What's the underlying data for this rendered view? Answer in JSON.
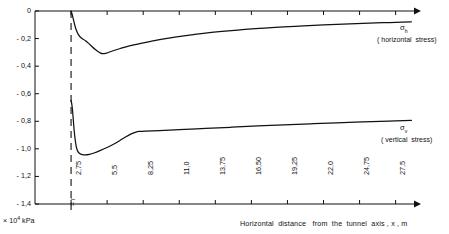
{
  "figure": {
    "background": "#ffffff",
    "ink": "#111111"
  },
  "axes": {
    "y": {
      "unit_prefix": "× 10",
      "unit_exp": "4",
      "unit_suffix": " kPa",
      "ticks": [
        "0",
        "- 0,2",
        "- 0,4",
        "- 0,6",
        "- 0,8",
        "- 1,0",
        "- 1,2",
        "- 1,4"
      ],
      "values": [
        0,
        -0.2,
        -0.4,
        -0.6,
        -0.8,
        -1.0,
        -1.2,
        -1.4
      ],
      "limits": [
        -1.4,
        0
      ]
    },
    "x": {
      "title": "Horizontal  distance   from  the  tunnel  axis , x , m",
      "ticks": [
        "2,75",
        "5,5",
        "8,25",
        "11,0",
        "13,75",
        "16,50",
        "19,25",
        "22,0",
        "24,75",
        "27,5"
      ],
      "values": [
        2.75,
        5.5,
        8.25,
        11.0,
        13.75,
        16.5,
        19.25,
        22.0,
        24.75,
        27.5
      ],
      "limits": [
        0,
        28.9
      ]
    },
    "tunnel_radius_marker": {
      "label": "= r",
      "x_value": 2.75
    }
  },
  "annotations": {
    "sigma_h": {
      "symbol": "σ",
      "subscript": "h",
      "description": "( horizontal  stress)"
    },
    "sigma_v": {
      "symbol": "σ",
      "subscript": "v",
      "description": "( vertical  stress)"
    }
  },
  "chart_data": {
    "type": "line",
    "title": "",
    "xlabel": "Horizontal  distance   from  the  tunnel  axis , x , m",
    "ylabel": "× 10⁴ kPa",
    "xlim": [
      0,
      28.9
    ],
    "ylim": [
      -1.4,
      0
    ],
    "grid": false,
    "legend_position": "right-inline",
    "xticks": [
      2.75,
      5.5,
      8.25,
      11.0,
      13.75,
      16.5,
      19.25,
      22.0,
      24.75,
      27.5
    ],
    "yticks": [
      0,
      -0.2,
      -0.4,
      -0.6,
      -0.8,
      -1.0,
      -1.2,
      -1.4
    ],
    "series": [
      {
        "name": "σh (horizontal stress)",
        "color": "#111111",
        "points": [
          [
            2.75,
            0.0
          ],
          [
            2.82,
            -0.02
          ],
          [
            2.95,
            -0.07
          ],
          [
            3.1,
            -0.125
          ],
          [
            3.3,
            -0.17
          ],
          [
            3.55,
            -0.198
          ],
          [
            3.85,
            -0.215
          ],
          [
            4.2,
            -0.245
          ],
          [
            4.6,
            -0.28
          ],
          [
            4.95,
            -0.303
          ],
          [
            5.15,
            -0.31
          ],
          [
            5.45,
            -0.305
          ],
          [
            5.9,
            -0.29
          ],
          [
            6.5,
            -0.272
          ],
          [
            7.2,
            -0.253
          ],
          [
            8.0,
            -0.236
          ],
          [
            9.0,
            -0.216
          ],
          [
            10.2,
            -0.196
          ],
          [
            11.5,
            -0.178
          ],
          [
            13.0,
            -0.16
          ],
          [
            14.5,
            -0.146
          ],
          [
            16.0,
            -0.134
          ],
          [
            17.5,
            -0.124
          ],
          [
            19.0,
            -0.116
          ],
          [
            20.5,
            -0.108
          ],
          [
            22.0,
            -0.101
          ],
          [
            23.5,
            -0.095
          ],
          [
            25.0,
            -0.09
          ],
          [
            26.5,
            -0.085
          ],
          [
            28.0,
            -0.081
          ],
          [
            28.7,
            -0.079
          ]
        ]
      },
      {
        "name": "σv (vertical stress)",
        "color": "#111111",
        "points": [
          [
            2.75,
            -0.648
          ],
          [
            2.8,
            -0.672
          ],
          [
            2.86,
            -0.72
          ],
          [
            2.93,
            -0.8
          ],
          [
            3.0,
            -0.88
          ],
          [
            3.08,
            -0.945
          ],
          [
            3.16,
            -0.99
          ],
          [
            3.26,
            -1.018
          ],
          [
            3.4,
            -1.034
          ],
          [
            3.6,
            -1.042
          ],
          [
            3.85,
            -1.044
          ],
          [
            4.15,
            -1.04
          ],
          [
            4.5,
            -1.03
          ],
          [
            4.95,
            -1.013
          ],
          [
            5.45,
            -0.992
          ],
          [
            5.95,
            -0.968
          ],
          [
            6.45,
            -0.941
          ],
          [
            6.9,
            -0.914
          ],
          [
            7.3,
            -0.893
          ],
          [
            7.65,
            -0.88
          ],
          [
            7.95,
            -0.874
          ],
          [
            8.4,
            -0.872
          ],
          [
            9.5,
            -0.868
          ],
          [
            11.0,
            -0.861
          ],
          [
            13.0,
            -0.852
          ],
          [
            15.0,
            -0.843
          ],
          [
            17.0,
            -0.834
          ],
          [
            19.0,
            -0.826
          ],
          [
            21.0,
            -0.818
          ],
          [
            23.0,
            -0.811
          ],
          [
            25.0,
            -0.805
          ],
          [
            27.0,
            -0.799
          ],
          [
            28.7,
            -0.794
          ]
        ]
      }
    ],
    "reference_lines": [
      {
        "name": "tunnel-wall",
        "orientation": "vertical",
        "x_value": 2.75,
        "style": "dashed",
        "label": "= r"
      }
    ]
  }
}
